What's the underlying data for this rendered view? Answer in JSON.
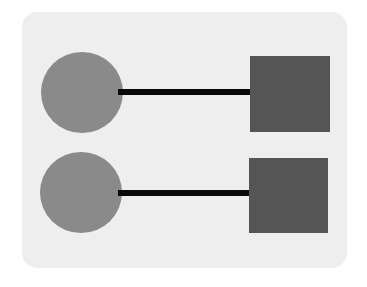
{
  "canvas": {
    "width": 367,
    "height": 287,
    "background_color": "#ffffff"
  },
  "card": {
    "background_color": "#eeeeee",
    "corner_radius": 15,
    "x": 22,
    "y": 12,
    "width": 325,
    "height": 256
  },
  "palette": {
    "circle_fill": "#8a8a8a",
    "square_fill": "#555555",
    "connector_stroke": "#0a0a0a",
    "panel_fill": "#eeeeee",
    "page_fill": "#ffffff"
  },
  "diagram": {
    "type": "node-link",
    "label": "",
    "rows": [
      {
        "id": "row-1",
        "source": {
          "shape": "circle",
          "label": "",
          "fill": "#8a8a8a",
          "x": 19,
          "y": 40,
          "width": 82,
          "height": 81
        },
        "connector": {
          "shape": "bar",
          "label": "",
          "fill": "#0a0a0a",
          "x": 96,
          "y": 77,
          "width": 134,
          "height": 6
        },
        "target": {
          "shape": "square",
          "label": "",
          "fill": "#555555",
          "x": 228,
          "y": 44,
          "width": 80,
          "height": 76
        }
      },
      {
        "id": "row-2",
        "source": {
          "shape": "circle",
          "label": "",
          "fill": "#8a8a8a",
          "x": 18,
          "y": 140,
          "width": 82,
          "height": 81
        },
        "connector": {
          "shape": "bar",
          "label": "",
          "fill": "#0a0a0a",
          "x": 96,
          "y": 178,
          "width": 133,
          "height": 6
        },
        "target": {
          "shape": "square",
          "label": "",
          "fill": "#555555",
          "x": 227,
          "y": 146,
          "width": 79,
          "height": 75
        }
      }
    ]
  }
}
